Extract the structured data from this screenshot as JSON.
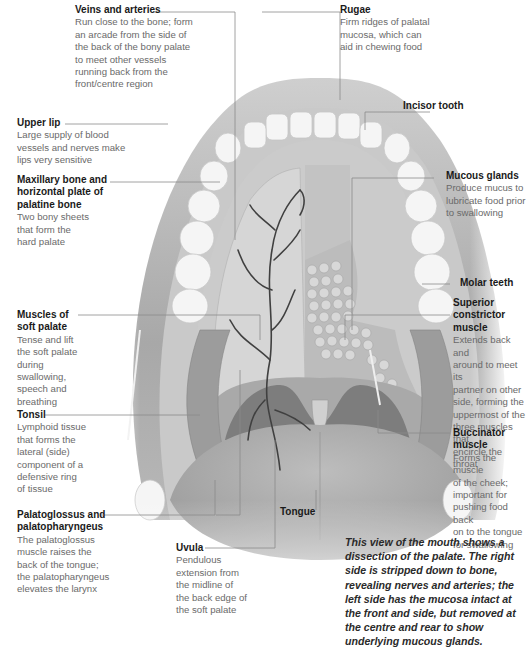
{
  "figure": {
    "caption": "This view of the mouth shows a dissection of the palate. The right side is stripped down to bone, revealing nerves and arteries; the left side has the mucosa intact at the front and side, but removed at the centre and rear to show underlying mucous glands."
  },
  "labels": {
    "veins_arteries": {
      "title": "Veins and arteries",
      "desc": [
        "Run close to the bone; form",
        "an arcade from the side of",
        "the back of the bony palate",
        "to meet other vessels",
        "running back from the",
        "front/centre region"
      ]
    },
    "rugae": {
      "title": "Rugae",
      "desc": [
        "Firm ridges of palatal",
        "mucosa, which can",
        "aid in chewing food"
      ]
    },
    "incisor_tooth": {
      "title": "Incisor tooth"
    },
    "upper_lip": {
      "title": "Upper lip",
      "desc": [
        "Large supply of blood",
        "vessels and nerves make",
        "lips very sensitive"
      ]
    },
    "maxillary_bone": {
      "title_lines": [
        "Maxillary bone and",
        "horizontal plate of",
        "palatine bone"
      ],
      "desc": [
        "Two bony sheets",
        "that form the",
        "hard palate"
      ]
    },
    "mucous_glands": {
      "title": "Mucous glands",
      "desc": [
        "Produce mucus to",
        "lubricate food prior",
        "to swallowing"
      ]
    },
    "molar_teeth": {
      "title": "Molar teeth"
    },
    "muscles_soft_palate": {
      "title_lines": [
        "Muscles of",
        "soft palate"
      ],
      "desc": [
        "Tense and lift",
        "the soft palate",
        "during",
        "swallowing,",
        "speech and",
        "breathing"
      ]
    },
    "superior_constrictor": {
      "title_lines": [
        "Superior",
        "constrictor",
        "muscle"
      ],
      "desc": [
        "Extends back and",
        "around to meet its",
        "partner on other",
        "side, forming the",
        "uppermost of the",
        "three muscles that",
        "encircle the throat"
      ]
    },
    "tonsil": {
      "title": "Tonsil",
      "desc": [
        "Lymphoid tissue",
        "that forms the",
        "lateral (side)",
        "component of a",
        "defensive ring",
        "of tissue"
      ]
    },
    "buccinator": {
      "title_lines": [
        "Buccinator",
        "muscle"
      ],
      "desc": [
        "Forms the muscle",
        "of the cheek;",
        "important for",
        "pushing food back",
        "on to the tongue",
        "for swallowing"
      ]
    },
    "palatoglossus": {
      "title_lines": [
        "Palatoglossus and",
        "palatopharyngeus"
      ],
      "desc": [
        "The palatoglossus",
        "muscle raises the",
        "back of the tongue;",
        "the palatopharyngeus",
        "elevates the larynx"
      ]
    },
    "uvula": {
      "title": "Uvula",
      "desc": [
        "Pendulous",
        "extension from",
        "the midline of",
        "the back edge of",
        "the soft palate"
      ]
    },
    "tongue": {
      "title": "Tongue"
    }
  },
  "colors": {
    "background": "#ffffff",
    "leader_line": "#8a8a8a",
    "tissue_dark": "#9a9a9a",
    "tissue_mid": "#bdbdbd",
    "tissue_light": "#d9d9d9",
    "tooth": "#f4f4f4",
    "vessel": "#3f3f3f"
  }
}
